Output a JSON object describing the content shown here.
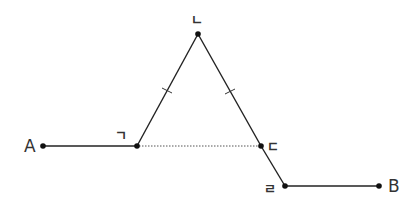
{
  "diagram": {
    "points": {
      "A": {
        "label": "A",
        "x": 43,
        "y": 146
      },
      "g": {
        "label": "ㄱ",
        "x": 137,
        "y": 146
      },
      "n": {
        "label": "ㄴ",
        "x": 198,
        "y": 34
      },
      "d": {
        "label": "ㄷ",
        "x": 261,
        "y": 146
      },
      "r": {
        "label": "ㄹ",
        "x": 285,
        "y": 186
      },
      "B": {
        "label": "B",
        "x": 379,
        "y": 186
      }
    },
    "segments": [
      {
        "from": "A",
        "to": "ㄱ",
        "style": "solid"
      },
      {
        "from": "ㄱ",
        "to": "ㄴ",
        "style": "solid",
        "tick_mark": true
      },
      {
        "from": "ㄴ",
        "to": "ㄷ",
        "style": "solid",
        "tick_mark": true
      },
      {
        "from": "ㄷ",
        "to": "ㄹ",
        "style": "solid"
      },
      {
        "from": "ㄹ",
        "to": "B",
        "style": "solid"
      },
      {
        "from": "ㄱ",
        "to": "ㄷ",
        "style": "dotted"
      }
    ],
    "annotations": {
      "equal_sides": [
        "ㄱㄴ",
        "ㄴㄷ"
      ]
    },
    "colors": {
      "line": "#222222",
      "dotted_line": "#555555",
      "label": "#333333",
      "background": "#ffffff"
    }
  }
}
